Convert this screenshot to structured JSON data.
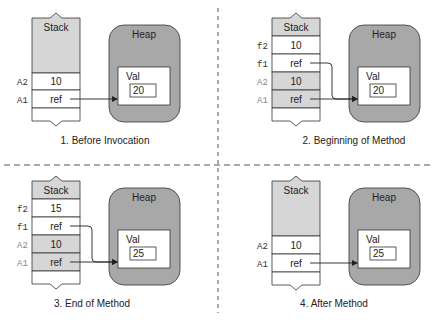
{
  "diagram": {
    "colors": {
      "stack_fill": "#d6d6d6",
      "heap_fill": "#a8a8a8",
      "cell_white": "#ffffff",
      "line": "#333333",
      "divider": "#555555"
    },
    "panels": [
      {
        "caption": "1. Before Invocation",
        "stack_label": "Stack",
        "heap_label": "Heap",
        "object_label": "Val",
        "object_value": "20",
        "rows": [
          {
            "name": "A2",
            "value": "10",
            "shaded": false,
            "name_gray": false
          },
          {
            "name": "A1",
            "value": "ref",
            "shaded": false,
            "name_gray": false
          }
        ]
      },
      {
        "caption": "2. Beginning of Method",
        "stack_label": "Stack",
        "heap_label": "Heap",
        "object_label": "Val",
        "object_value": "20",
        "rows": [
          {
            "name": "f2",
            "value": "10",
            "shaded": false,
            "name_gray": false
          },
          {
            "name": "f1",
            "value": "ref",
            "shaded": false,
            "name_gray": false
          },
          {
            "name": "A2",
            "value": "10",
            "shaded": true,
            "name_gray": true
          },
          {
            "name": "A1",
            "value": "ref",
            "shaded": true,
            "name_gray": true
          }
        ]
      },
      {
        "caption": "3. End of Method",
        "stack_label": "Stack",
        "heap_label": "Heap",
        "object_label": "Val",
        "object_value": "25",
        "rows": [
          {
            "name": "f2",
            "value": "15",
            "shaded": false,
            "name_gray": false
          },
          {
            "name": "f1",
            "value": "ref",
            "shaded": false,
            "name_gray": false
          },
          {
            "name": "A2",
            "value": "10",
            "shaded": true,
            "name_gray": true
          },
          {
            "name": "A1",
            "value": "ref",
            "shaded": true,
            "name_gray": true
          }
        ]
      },
      {
        "caption": "4. After Method",
        "stack_label": "Stack",
        "heap_label": "Heap",
        "object_label": "Val",
        "object_value": "25",
        "rows": [
          {
            "name": "A2",
            "value": "10",
            "shaded": false,
            "name_gray": false
          },
          {
            "name": "A1",
            "value": "ref",
            "shaded": false,
            "name_gray": false
          }
        ]
      }
    ]
  }
}
